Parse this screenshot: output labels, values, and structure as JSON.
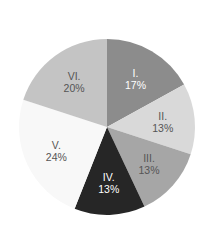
{
  "chart_data": {
    "type": "pie",
    "title": "",
    "categories": [
      "I.",
      "II.",
      "III.",
      "IV.",
      "V.",
      "VI."
    ],
    "values": [
      17,
      13,
      13,
      13,
      24,
      20
    ],
    "value_labels": [
      "17%",
      "13%",
      "13%",
      "13%",
      "24%",
      "20%"
    ],
    "colors": [
      "#8c8c8c",
      "#d9d9d9",
      "#a6a6a6",
      "#262626",
      "#f8f8f8",
      "#c4c4c4"
    ],
    "label_colors": [
      "#ffffff",
      "#555555",
      "#555555",
      "#ffffff",
      "#555555",
      "#555555"
    ],
    "start_angle": "12 o'clock",
    "direction": "clockwise",
    "legend": "none",
    "labels_inside": true
  }
}
